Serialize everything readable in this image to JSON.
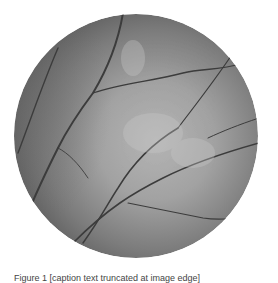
{
  "figure": {
    "type": "fundus-photograph",
    "colors": {
      "background": "#ffffff",
      "fundus_dark": "#5e5e5e",
      "fundus_mid": "#858585",
      "fundus_light": "#b4b4b4",
      "vessel": "#3a3a3a"
    },
    "caption": "Figure 1 [caption text truncated at image edge]"
  }
}
